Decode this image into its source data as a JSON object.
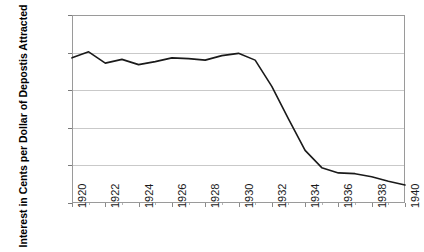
{
  "chart_data": {
    "type": "line",
    "title": "",
    "xlabel": "",
    "ylabel": "Interest in Cents per Dollar of Depostis Attracted",
    "xlim": [
      1920,
      1940
    ],
    "ylim": [
      0,
      2.5
    ],
    "grid": true,
    "legend": "none",
    "x_tick_labels": [
      "1920",
      "1922",
      "1924",
      "1926",
      "1928",
      "1930",
      "1932",
      "1934",
      "1936",
      "1938",
      "1940"
    ],
    "x_tick_values": [
      1920,
      1922,
      1924,
      1926,
      1928,
      1930,
      1932,
      1934,
      1936,
      1938,
      1940
    ],
    "y_tick_labels": [
      "0",
      "0.5",
      "1",
      "1.5",
      "2",
      "2.5"
    ],
    "y_tick_values": [
      0,
      0.5,
      1,
      1.5,
      2,
      2.5
    ],
    "x": [
      1920,
      1921,
      1922,
      1923,
      1924,
      1925,
      1926,
      1927,
      1928,
      1929,
      1930,
      1931,
      1932,
      1933,
      1934,
      1935,
      1936,
      1937,
      1938,
      1939,
      1940
    ],
    "series": [
      {
        "name": "Interest per Dollar of Deposits",
        "color": "#1a1a1a",
        "values": [
          1.93,
          2.01,
          1.86,
          1.91,
          1.84,
          1.88,
          1.93,
          1.92,
          1.9,
          1.96,
          1.99,
          1.9,
          1.55,
          1.12,
          0.7,
          0.47,
          0.4,
          0.39,
          0.35,
          0.29,
          0.24
        ]
      }
    ]
  }
}
